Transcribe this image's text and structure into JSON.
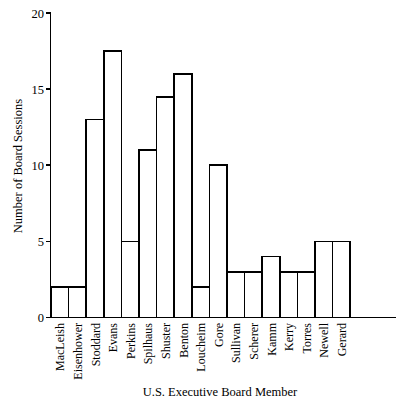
{
  "chart_data": {
    "type": "bar",
    "title": "",
    "xlabel": "U.S. Executive Board Member",
    "ylabel": "Number of Board Sessions",
    "categories": [
      "MacLeish",
      "Eisenhower",
      "Stoddard",
      "Evans",
      "Perkins",
      "Spilhaus",
      "Shuster",
      "Benton",
      "Loucheim",
      "Gore",
      "Sullivan",
      "Scherer",
      "Kamm",
      "Kerry",
      "Torres",
      "Newell",
      "Gerard"
    ],
    "values": [
      2,
      2,
      13,
      17.5,
      5,
      11,
      14.5,
      16,
      2,
      10,
      3,
      3,
      4,
      3,
      3,
      5,
      5
    ],
    "ylim": [
      0,
      20
    ],
    "yticks": [
      0,
      5,
      10,
      15,
      20
    ],
    "ytick_labels": [
      "0",
      "5",
      "10",
      "15",
      "20"
    ],
    "grid": false,
    "legend": null,
    "bar_fill": "#ffffff",
    "bar_stroke": "#000000",
    "background": "#ffffff"
  },
  "axis": {
    "y_title": "Number of Board Sessions",
    "x_title": "U.S. Executive Board Member"
  }
}
